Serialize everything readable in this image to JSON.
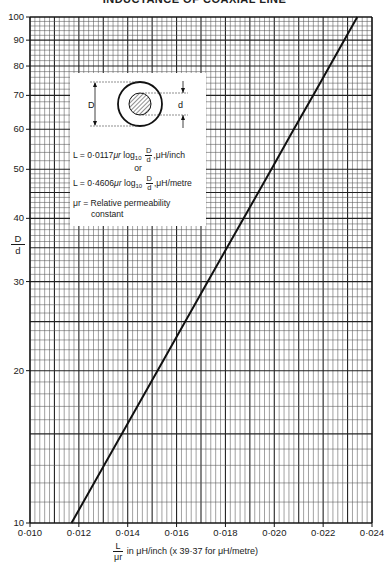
{
  "title": "INDUCTANCE OF COAXIAL LINE",
  "inset": {
    "diagram_labels": {
      "outer": "D",
      "inner": "d"
    },
    "formula_inch": {
      "prefix": "L = 0·0117",
      "mu": "μr",
      "log": "log",
      "base": "10",
      "num": "D",
      "den": "d",
      "unit": ",μH/inch"
    },
    "or_text": "or",
    "formula_metre": {
      "prefix": "L = 0·4606",
      "mu": "μr",
      "log": "log",
      "base": "10",
      "num": "D",
      "den": "d",
      "unit": ",μH/metre"
    },
    "note_line1": "μr = Relative permeability",
    "note_line2": "constant"
  },
  "axes": {
    "y_title_num": "D",
    "y_title_den": "d",
    "x_title_num": "L",
    "x_title_den": "μr",
    "x_title_rest": "in μH/inch  (x 39·37 for μH/metre)"
  },
  "chart_data": {
    "type": "line",
    "title": "INDUCTANCE OF COAXIAL LINE",
    "xlabel": "L/μr in μH/inch (x 39·37 for μH/metre)",
    "ylabel": "D/d",
    "xlim": [
      0.01,
      0.024
    ],
    "ylim": [
      10,
      100
    ],
    "yscale": "log",
    "xscale": "linear",
    "grid": true,
    "x_ticks": [
      0.01,
      0.012,
      0.014,
      0.016,
      0.018,
      0.02,
      0.022,
      0.024
    ],
    "x_tick_labels": [
      "0·010",
      "0·012",
      "0·014",
      "0·016",
      "0·018",
      "0·020",
      "0·022",
      "0·024"
    ],
    "y_ticks": [
      10,
      20,
      30,
      40,
      50,
      60,
      70,
      80,
      90,
      100
    ],
    "y_tick_labels": [
      "10",
      "20",
      "30",
      "40",
      "50",
      "60",
      "70",
      "80",
      "90",
      "100"
    ],
    "series": [
      {
        "name": "L/μr = 0·0117 log10(D/d)",
        "x": [
          0.0117,
          0.01404,
          0.01521,
          0.01638,
          0.01755,
          0.01872,
          0.01989,
          0.02106,
          0.02223,
          0.0234
        ],
        "y": [
          10,
          10,
          20,
          30,
          40,
          50,
          60,
          70,
          80,
          100
        ]
      }
    ],
    "points": [
      {
        "y": 10,
        "x": 0.0117
      },
      {
        "y": 20,
        "x": 0.01522
      },
      {
        "y": 30,
        "x": 0.01728
      },
      {
        "y": 40,
        "x": 0.01874
      },
      {
        "y": 50,
        "x": 0.01988
      },
      {
        "y": 60,
        "x": 0.0208
      },
      {
        "y": 70,
        "x": 0.02159
      },
      {
        "y": 80,
        "x": 0.02227
      },
      {
        "y": 90,
        "x": 0.02286
      },
      {
        "y": 100,
        "x": 0.0234
      }
    ],
    "annotations": [
      "L = 0·0117 μr log10 D/d, μH/inch",
      "or",
      "L = 0·4606 μr log10 D/d, μH/metre",
      "μr = Relative permeability constant"
    ]
  }
}
